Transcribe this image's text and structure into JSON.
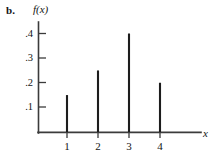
{
  "figure": {
    "part_label": "b.",
    "y_axis_label": "f(x)",
    "x_axis_label": "x"
  },
  "chart_data": {
    "type": "bar",
    "subtype": "probability-mass-spike-plot",
    "title": "",
    "subtitle": "",
    "xlabel": "x",
    "ylabel": "f(x)",
    "categories": [
      "1",
      "2",
      "3",
      "4"
    ],
    "x": [
      1,
      2,
      3,
      4
    ],
    "values": [
      0.15,
      0.25,
      0.4,
      0.2
    ],
    "value_labels": [
      ".15",
      ".25",
      ".4",
      ".2"
    ],
    "xlim": [
      0,
      5
    ],
    "ylim": [
      0,
      0.44
    ],
    "grid": false,
    "legend": false,
    "legend_position": "none",
    "x_ticks": [
      1,
      2,
      3,
      4
    ],
    "x_tick_labels": [
      "1",
      "2",
      "3",
      "4"
    ],
    "y_ticks": [
      0.1,
      0.2,
      0.3,
      0.4
    ],
    "y_tick_labels": [
      ".1",
      ".2",
      ".3",
      ".4"
    ],
    "series": [
      {
        "name": "f(x)",
        "values": [
          0.15,
          0.25,
          0.4,
          0.2
        ]
      }
    ],
    "colors": {
      "spike": "#1d1d1d",
      "axis": "#3b3b3b",
      "background": "#ffffff",
      "text": "#141414"
    }
  }
}
